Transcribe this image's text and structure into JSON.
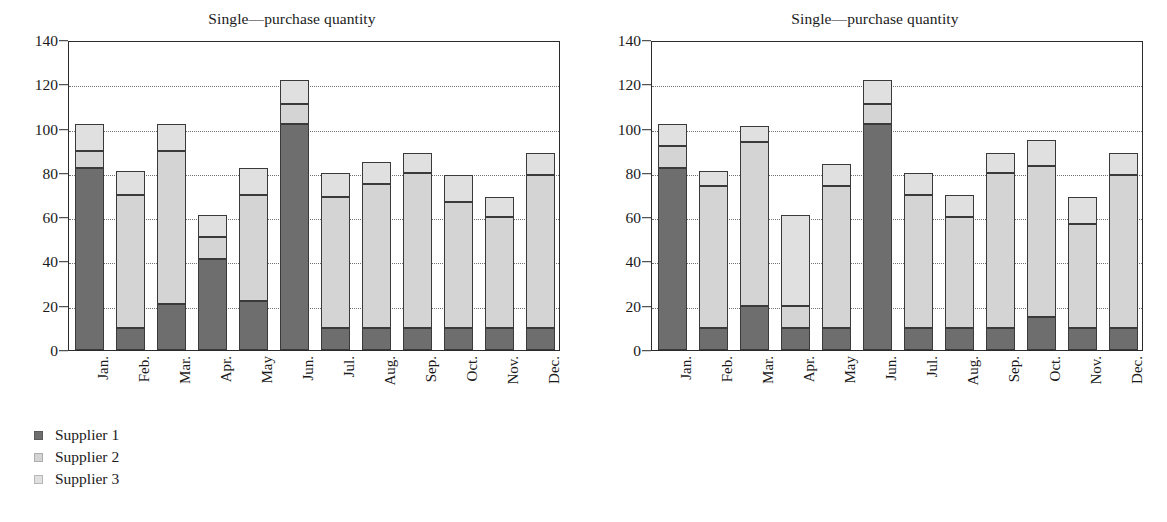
{
  "figure": {
    "panels": [
      {
        "id": "left",
        "title": "Single—purchase quantity"
      },
      {
        "id": "right",
        "title": "Single—purchase quantity"
      }
    ]
  },
  "legend": {
    "entries": [
      {
        "label": "Supplier 1",
        "color": "#6e6e6e"
      },
      {
        "label": "Supplier 2",
        "color": "#d4d4d4"
      },
      {
        "label": "Supplier 3",
        "color": "#e0e0e0"
      }
    ]
  },
  "axis": {
    "y_ticks": [
      "0",
      "20",
      "40",
      "60",
      "80",
      "100",
      "120",
      "140"
    ],
    "x_ticks": [
      "Jan.",
      "Feb.",
      "Mar.",
      "Apr.",
      "May",
      "Jun.",
      "Jul.",
      "Aug.",
      "Sep.",
      "Oct.",
      "Nov.",
      "Dec."
    ]
  },
  "chart_data": [
    {
      "type": "bar",
      "stacked": true,
      "panel": "left",
      "title": "Single—purchase quantity",
      "xlabel": "",
      "ylabel": "",
      "ylim": [
        0,
        140
      ],
      "ytick_step": 20,
      "grid": "horizontal-dotted",
      "legend_position": "below-left",
      "categories": [
        "Jan.",
        "Feb.",
        "Mar.",
        "Apr.",
        "May",
        "Jun.",
        "Jul.",
        "Aug.",
        "Sep.",
        "Oct.",
        "Nov.",
        "Dec."
      ],
      "series": [
        {
          "name": "Supplier 1",
          "color": "#6e6e6e",
          "values": [
            82,
            10,
            21,
            41,
            22,
            102,
            10,
            10,
            10,
            10,
            10,
            10
          ]
        },
        {
          "name": "Supplier 2",
          "color": "#d4d4d4",
          "values": [
            8,
            60,
            69,
            10,
            48,
            9,
            59,
            65,
            70,
            57,
            50,
            69
          ]
        },
        {
          "name": "Supplier 3",
          "color": "#e0e0e0",
          "values": [
            12,
            11,
            12,
            10,
            12,
            11,
            11,
            10,
            9,
            12,
            9,
            10
          ]
        }
      ],
      "cumulative_tops": [
        [
          82,
          90,
          102
        ],
        [
          10,
          70,
          81
        ],
        [
          21,
          90,
          102
        ],
        [
          41,
          51,
          61
        ],
        [
          22,
          70,
          82
        ],
        [
          102,
          111,
          122
        ],
        [
          10,
          69,
          80
        ],
        [
          10,
          75,
          85
        ],
        [
          10,
          80,
          89
        ],
        [
          10,
          67,
          79
        ],
        [
          10,
          60,
          69
        ],
        [
          10,
          79,
          89
        ]
      ],
      "totals": [
        102,
        81,
        102,
        61,
        82,
        122,
        80,
        85,
        89,
        79,
        69,
        89
      ]
    },
    {
      "type": "bar",
      "stacked": true,
      "panel": "right",
      "title": "Single—purchase quantity",
      "xlabel": "",
      "ylabel": "",
      "ylim": [
        0,
        140
      ],
      "ytick_step": 20,
      "grid": "horizontal-dotted",
      "legend_position": "below-left",
      "categories": [
        "Jan.",
        "Feb.",
        "Mar.",
        "Apr.",
        "May",
        "Jun.",
        "Jul.",
        "Aug.",
        "Sep.",
        "Oct.",
        "Nov.",
        "Dec."
      ],
      "series": [
        {
          "name": "Supplier 1",
          "color": "#6e6e6e",
          "values": [
            82,
            10,
            20,
            10,
            10,
            102,
            10,
            10,
            10,
            15,
            10,
            10
          ]
        },
        {
          "name": "Supplier 2",
          "color": "#d4d4d4",
          "values": [
            10,
            64,
            74,
            10,
            64,
            9,
            60,
            50,
            70,
            68,
            47,
            69
          ]
        },
        {
          "name": "Supplier 3",
          "color": "#e0e0e0",
          "values": [
            10,
            7,
            7,
            41,
            10,
            11,
            10,
            10,
            9,
            12,
            12,
            10
          ]
        }
      ],
      "cumulative_tops": [
        [
          82,
          92,
          102
        ],
        [
          10,
          74,
          81
        ],
        [
          20,
          94,
          101
        ],
        [
          10,
          20,
          61
        ],
        [
          10,
          74,
          84
        ],
        [
          102,
          111,
          122
        ],
        [
          10,
          70,
          80
        ],
        [
          10,
          60,
          70
        ],
        [
          10,
          80,
          89
        ],
        [
          15,
          83,
          95
        ],
        [
          10,
          57,
          69
        ],
        [
          10,
          79,
          89
        ]
      ],
      "totals": [
        102,
        81,
        101,
        61,
        84,
        122,
        80,
        70,
        89,
        95,
        69,
        89
      ]
    }
  ]
}
